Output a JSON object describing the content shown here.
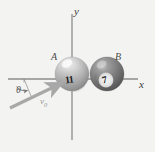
{
  "figure": {
    "type": "physics-diagram",
    "background_color": "#f3f3f2",
    "axes": {
      "x_label": "x",
      "y_label": "y",
      "origin_px": [
        72,
        79
      ],
      "axis_color": "#8c8c8c"
    },
    "balls": [
      {
        "id": "A",
        "label": "A",
        "number": "11",
        "center_px": [
          72,
          74
        ],
        "radius_px": 17,
        "shade": "light",
        "base_color": "#b9b9b9",
        "highlight_color": "#efefef"
      },
      {
        "id": "B",
        "label": "B",
        "number": "7",
        "center_px": [
          107,
          74
        ],
        "radius_px": 17,
        "shade": "dark",
        "base_color": "#6f6f6f",
        "highlight_color": "#cfcfcf"
      }
    ],
    "vector": {
      "label": "v",
      "subscript": "0",
      "color": "#a8a8a8",
      "tail_px": [
        10,
        108
      ],
      "head_px": [
        60,
        84
      ]
    },
    "angle": {
      "label": "θ",
      "arc_color": "#6f6f6f",
      "vertex_px": [
        22,
        79
      ]
    }
  }
}
